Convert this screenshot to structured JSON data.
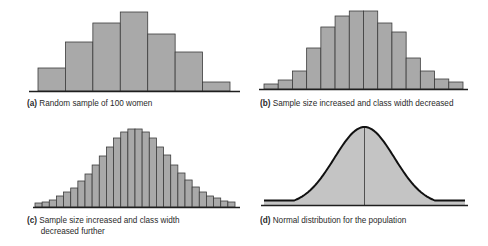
{
  "colors": {
    "bar_fill": "#a9a9a9",
    "bar_edge": "#3c3c3c",
    "curve_fill": "#c4c4c4",
    "axis": "#1e1e1e",
    "text": "#2a2a2a"
  },
  "chart_data": [
    {
      "id": "a",
      "type": "bar",
      "title": "Random sample of 100 women",
      "label_prefix": "(a)",
      "categories": [
        "1",
        "2",
        "3",
        "4",
        "5",
        "6",
        "7"
      ],
      "values": [
        23,
        49,
        68,
        79,
        57,
        39,
        9
      ],
      "xlabel": "",
      "ylabel": "",
      "grid": false
    },
    {
      "id": "b",
      "type": "bar",
      "title": "Sample size increased and class width decreased",
      "label_prefix": "(b)",
      "categories": [
        "1",
        "2",
        "3",
        "4",
        "5",
        "6",
        "7",
        "8",
        "9",
        "10",
        "11",
        "12",
        "13",
        "14"
      ],
      "values": [
        5,
        9,
        18,
        41,
        62,
        73,
        78,
        78,
        66,
        57,
        31,
        18,
        10,
        7
      ],
      "xlabel": "",
      "ylabel": "",
      "grid": false
    },
    {
      "id": "c",
      "type": "bar",
      "title": "Sample size increased and class width decreased further",
      "title_lines": [
        "Sample size increased and class width",
        "decreased further"
      ],
      "label_prefix": "(c)",
      "categories": [
        "1",
        "2",
        "3",
        "4",
        "5",
        "6",
        "7",
        "8",
        "9",
        "10",
        "11",
        "12",
        "13",
        "14",
        "15",
        "16",
        "17",
        "18",
        "19",
        "20",
        "21",
        "22",
        "23",
        "24",
        "25",
        "26",
        "27",
        "28"
      ],
      "values": [
        4,
        5,
        7,
        11,
        15,
        19,
        26,
        33,
        42,
        51,
        60,
        69,
        75,
        78,
        78,
        75,
        69,
        60,
        52,
        42,
        34,
        27,
        20,
        15,
        11,
        9,
        6,
        5
      ],
      "xlabel": "",
      "ylabel": "",
      "grid": false
    },
    {
      "id": "d",
      "type": "area",
      "title": "Normal distribution for the population",
      "label_prefix": "(d)",
      "distribution": "normal",
      "mean_line": true,
      "xlabel": "",
      "ylabel": "",
      "grid": false
    }
  ]
}
